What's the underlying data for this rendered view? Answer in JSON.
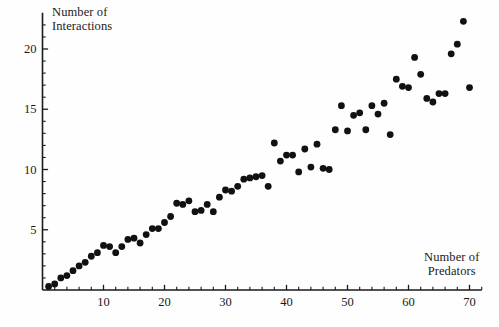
{
  "chart_data": {
    "type": "scatter",
    "title": "",
    "xlabel": "Number of\nPredators",
    "ylabel": "Number of\nInteractions",
    "xlim": [
      0,
      72
    ],
    "ylim": [
      0,
      23
    ],
    "xticks_major": [
      10,
      20,
      30,
      40,
      50,
      60,
      70
    ],
    "xticks_minor": [
      2,
      4,
      6,
      8,
      12,
      14,
      16,
      18,
      22,
      24,
      26,
      28,
      32,
      34,
      36,
      38,
      42,
      44,
      46,
      48,
      52,
      54,
      56,
      58,
      62,
      64,
      66,
      68,
      72
    ],
    "yticks_major": [
      5,
      10,
      15,
      20
    ],
    "yticks_minor": [
      1,
      2,
      3,
      4,
      6,
      7,
      8,
      9,
      11,
      12,
      13,
      14,
      16,
      17,
      18,
      19,
      21,
      22
    ],
    "xtick_labels": [
      "10",
      "20",
      "30",
      "40",
      "50",
      "60",
      "70"
    ],
    "ytick_labels": [
      "5",
      "10",
      "15",
      "20"
    ],
    "grid": false,
    "legend": false,
    "marker": {
      "shape": "circle",
      "size": 3.4,
      "color": "#111111"
    },
    "axis_color": "#1a1a1a",
    "points": [
      {
        "x": 1,
        "y": 0.3
      },
      {
        "x": 2,
        "y": 0.5
      },
      {
        "x": 3,
        "y": 1.0
      },
      {
        "x": 4,
        "y": 1.2
      },
      {
        "x": 5,
        "y": 1.6
      },
      {
        "x": 6,
        "y": 2.0
      },
      {
        "x": 7,
        "y": 2.3
      },
      {
        "x": 8,
        "y": 2.8
      },
      {
        "x": 9,
        "y": 3.1
      },
      {
        "x": 10,
        "y": 3.7
      },
      {
        "x": 11,
        "y": 3.6
      },
      {
        "x": 12,
        "y": 3.1
      },
      {
        "x": 13,
        "y": 3.6
      },
      {
        "x": 14,
        "y": 4.2
      },
      {
        "x": 15,
        "y": 4.3
      },
      {
        "x": 16,
        "y": 3.9
      },
      {
        "x": 17,
        "y": 4.6
      },
      {
        "x": 18,
        "y": 5.1
      },
      {
        "x": 19,
        "y": 5.1
      },
      {
        "x": 20,
        "y": 5.6
      },
      {
        "x": 21,
        "y": 6.1
      },
      {
        "x": 22,
        "y": 7.2
      },
      {
        "x": 23,
        "y": 7.1
      },
      {
        "x": 24,
        "y": 7.4
      },
      {
        "x": 25,
        "y": 6.5
      },
      {
        "x": 26,
        "y": 6.6
      },
      {
        "x": 27,
        "y": 7.1
      },
      {
        "x": 28,
        "y": 6.5
      },
      {
        "x": 29,
        "y": 7.7
      },
      {
        "x": 30,
        "y": 8.3
      },
      {
        "x": 31,
        "y": 8.2
      },
      {
        "x": 32,
        "y": 8.6
      },
      {
        "x": 33,
        "y": 9.2
      },
      {
        "x": 34,
        "y": 9.3
      },
      {
        "x": 35,
        "y": 9.4
      },
      {
        "x": 36,
        "y": 9.5
      },
      {
        "x": 37,
        "y": 8.6
      },
      {
        "x": 38,
        "y": 12.2
      },
      {
        "x": 39,
        "y": 10.7
      },
      {
        "x": 40,
        "y": 11.2
      },
      {
        "x": 41,
        "y": 11.2
      },
      {
        "x": 42,
        "y": 9.8
      },
      {
        "x": 43,
        "y": 11.7
      },
      {
        "x": 44,
        "y": 10.2
      },
      {
        "x": 45,
        "y": 12.1
      },
      {
        "x": 46,
        "y": 10.1
      },
      {
        "x": 47,
        "y": 10.0
      },
      {
        "x": 48,
        "y": 13.3
      },
      {
        "x": 49,
        "y": 15.3
      },
      {
        "x": 50,
        "y": 13.2
      },
      {
        "x": 51,
        "y": 14.5
      },
      {
        "x": 52,
        "y": 14.7
      },
      {
        "x": 53,
        "y": 13.3
      },
      {
        "x": 54,
        "y": 15.3
      },
      {
        "x": 55,
        "y": 14.6
      },
      {
        "x": 56,
        "y": 15.5
      },
      {
        "x": 57,
        "y": 12.9
      },
      {
        "x": 58,
        "y": 17.5
      },
      {
        "x": 59,
        "y": 16.9
      },
      {
        "x": 60,
        "y": 16.8
      },
      {
        "x": 61,
        "y": 19.3
      },
      {
        "x": 62,
        "y": 17.9
      },
      {
        "x": 63,
        "y": 15.9
      },
      {
        "x": 64,
        "y": 15.6
      },
      {
        "x": 65,
        "y": 16.3
      },
      {
        "x": 66,
        "y": 16.3
      },
      {
        "x": 67,
        "y": 19.6
      },
      {
        "x": 68,
        "y": 20.4
      },
      {
        "x": 69,
        "y": 22.3
      },
      {
        "x": 70,
        "y": 16.8
      }
    ]
  }
}
